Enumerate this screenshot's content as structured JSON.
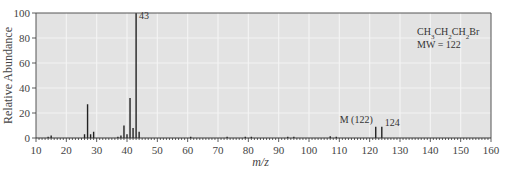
{
  "chart_data": {
    "type": "bar",
    "title": "",
    "compound": "CH3CH2CH2Br",
    "compound_display": [
      {
        "t": "CH"
      },
      {
        "t": "3",
        "sub": true
      },
      {
        "t": "CH"
      },
      {
        "t": "2",
        "sub": true
      },
      {
        "t": "CH"
      },
      {
        "t": "2",
        "sub": true
      },
      {
        "t": "Br"
      }
    ],
    "mw_label": "MW = 122",
    "xlabel": "m/z",
    "ylabel": "Relative Abundance",
    "xlim": [
      10,
      160
    ],
    "ylim": [
      0,
      100
    ],
    "xticks": [
      10,
      20,
      30,
      40,
      50,
      60,
      70,
      80,
      90,
      100,
      110,
      120,
      130,
      140,
      150,
      160
    ],
    "yticks": [
      0,
      20,
      40,
      60,
      80,
      100
    ],
    "grid": true,
    "background": "#e3e3e3",
    "bar_color": "#222222",
    "peaks": [
      {
        "mz": 14,
        "abundance": 1
      },
      {
        "mz": 15,
        "abundance": 2
      },
      {
        "mz": 26,
        "abundance": 3
      },
      {
        "mz": 27,
        "abundance": 27
      },
      {
        "mz": 28,
        "abundance": 3
      },
      {
        "mz": 29,
        "abundance": 5
      },
      {
        "mz": 37,
        "abundance": 1
      },
      {
        "mz": 38,
        "abundance": 2
      },
      {
        "mz": 39,
        "abundance": 10
      },
      {
        "mz": 40,
        "abundance": 3
      },
      {
        "mz": 41,
        "abundance": 32
      },
      {
        "mz": 42,
        "abundance": 8
      },
      {
        "mz": 43,
        "abundance": 100
      },
      {
        "mz": 44,
        "abundance": 5
      },
      {
        "mz": 61,
        "abundance": 1
      },
      {
        "mz": 73,
        "abundance": 1
      },
      {
        "mz": 79,
        "abundance": 1
      },
      {
        "mz": 81,
        "abundance": 1
      },
      {
        "mz": 93,
        "abundance": 1
      },
      {
        "mz": 95,
        "abundance": 1
      },
      {
        "mz": 107,
        "abundance": 1.5
      },
      {
        "mz": 109,
        "abundance": 1
      },
      {
        "mz": 122,
        "abundance": 9
      },
      {
        "mz": 124,
        "abundance": 9
      }
    ],
    "annotations": [
      {
        "text": "43",
        "mz": 43,
        "y": 95
      },
      {
        "text": "M (122)",
        "mz": 122,
        "y": 12,
        "anchor": "end"
      },
      {
        "text": "124",
        "mz": 124,
        "y": 10
      }
    ]
  }
}
